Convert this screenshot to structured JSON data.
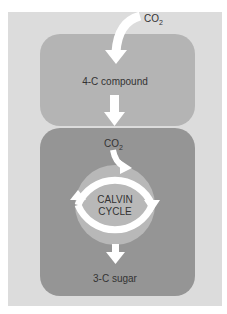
{
  "diagram": {
    "input_label": "CO",
    "input_sub": "2",
    "top_box_label": "4-C compound",
    "released_label": "CO",
    "released_sub": "2",
    "cycle_label_line1": "CALVIN",
    "cycle_label_line2": "CYCLE",
    "output_label": "3-C sugar"
  },
  "colors": {
    "background": "#dcdcdc",
    "top_box": "#b4b4b4",
    "bottom_box": "#959595",
    "cycle_circle": "#b8b8b8",
    "arrows": "#ffffff",
    "text": "#333333"
  }
}
